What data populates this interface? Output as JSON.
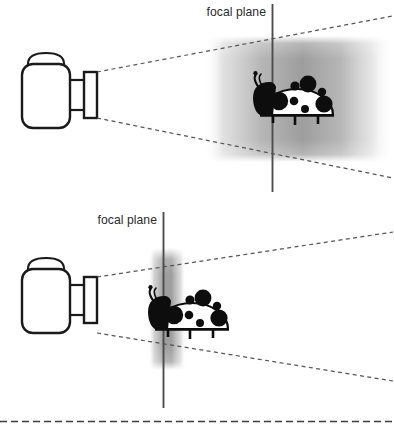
{
  "figure": {
    "background_color": "#ffffff",
    "stroke_color": "#1a1a1a",
    "subject_fill": "#0d0d0d",
    "blur_band_color": "#8c8c8c",
    "dashed_line_color": "#555555",
    "panels": [
      {
        "id": "panel-top",
        "name": "shallow-depth-of-field-panel",
        "focal_plane_label": "focal plane",
        "focal_plane_x": 272,
        "focal_plane_y_top": 4,
        "focal_plane_y_bottom": 192,
        "blur_band": {
          "x_start": 204,
          "x_end": 394,
          "y_top": 38,
          "y_bottom": 160,
          "description": "wide in-focus zone"
        },
        "camera": {
          "name": "camera",
          "body_x": 22,
          "body_y": 62,
          "body_w": 48,
          "body_h": 68
        },
        "subject": {
          "name": "ladybug",
          "center_x": 298,
          "center_y": 98,
          "sharpness": "sharp"
        },
        "ray_lines": 2
      },
      {
        "id": "panel-bottom",
        "name": "deep-depth-of-field-panel",
        "focal_plane_label": "focal plane",
        "focal_plane_x": 163,
        "focal_plane_y_top": 212,
        "focal_plane_y_bottom": 408,
        "blur_band": {
          "x_start": 152,
          "x_end": 182,
          "y_top": 250,
          "y_bottom": 367,
          "description": "narrow in-focus zone"
        },
        "camera": {
          "name": "camera",
          "body_x": 22,
          "body_y": 267,
          "body_w": 48,
          "body_h": 68
        },
        "subject": {
          "name": "ladybug",
          "center_x": 192,
          "center_y": 312,
          "sharpness": "sharp"
        },
        "ray_lines": 2
      }
    ],
    "bottom_divider": {
      "name": "page-divider",
      "y": 421,
      "style": "dashed",
      "dash_length": 7,
      "gap_length": 4
    }
  }
}
